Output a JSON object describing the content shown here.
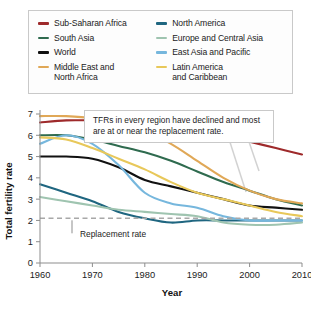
{
  "legend": {
    "items": [
      {
        "label": "Sub-Saharan Africa",
        "color": "#9e2a2b",
        "column": "left"
      },
      {
        "label": "South Asia",
        "color": "#2f6b4f",
        "column": "left"
      },
      {
        "label": "World",
        "color": "#111111",
        "column": "left"
      },
      {
        "label": "Middle East and\nNorth Africa",
        "color": "#e0a857",
        "column": "left"
      },
      {
        "label": "North America",
        "color": "#1f6680",
        "column": "right"
      },
      {
        "label": "Europe and Central Asia",
        "color": "#9fc4b0",
        "column": "right"
      },
      {
        "label": "East Asia and Pacific",
        "color": "#76b7dd",
        "column": "right"
      },
      {
        "label": "Latin America\nand Caribbean",
        "color": "#e8c85a",
        "column": "right"
      }
    ]
  },
  "annotation": {
    "text": "TFRs in every region have declined and most are at or near the replacement rate."
  },
  "replacement": {
    "label": "Replacement rate",
    "value": 2.1
  },
  "chart_data": {
    "type": "line",
    "title": "",
    "xlabel": "Year",
    "ylabel": "Total fertility rate",
    "xlim": [
      1960,
      2010
    ],
    "ylim": [
      0,
      7
    ],
    "xticks": [
      1960,
      1970,
      1980,
      1990,
      2000,
      2010
    ],
    "yticks": [
      0,
      1,
      2,
      3,
      4,
      5,
      6,
      7
    ],
    "grid": false,
    "legend_position": "top",
    "x": [
      1960,
      1965,
      1970,
      1975,
      1980,
      1985,
      1990,
      1995,
      2000,
      2005,
      2010
    ],
    "series": [
      {
        "name": "Sub-Saharan Africa",
        "color": "#9e2a2b",
        "values": [
          6.6,
          6.7,
          6.7,
          6.7,
          6.7,
          6.6,
          6.3,
          6.0,
          5.7,
          5.4,
          5.1
        ]
      },
      {
        "name": "South Asia",
        "color": "#2f6b4f",
        "values": [
          6.0,
          6.0,
          5.8,
          5.5,
          5.2,
          4.8,
          4.3,
          3.8,
          3.4,
          3.0,
          2.7
        ]
      },
      {
        "name": "World",
        "color": "#111111",
        "values": [
          5.0,
          5.0,
          4.9,
          4.5,
          3.9,
          3.6,
          3.3,
          3.0,
          2.7,
          2.6,
          2.5
        ]
      },
      {
        "name": "Middle East and North Africa",
        "color": "#e0a857",
        "values": [
          6.9,
          6.9,
          6.8,
          6.5,
          6.2,
          5.6,
          4.8,
          4.0,
          3.4,
          3.0,
          2.8
        ]
      },
      {
        "name": "North America",
        "color": "#1f6680",
        "values": [
          3.7,
          3.3,
          2.9,
          2.4,
          2.1,
          1.9,
          2.0,
          2.0,
          2.0,
          2.0,
          2.0
        ]
      },
      {
        "name": "Europe and Central Asia",
        "color": "#9fc4b0",
        "values": [
          3.1,
          2.9,
          2.7,
          2.5,
          2.4,
          2.3,
          2.2,
          1.9,
          1.8,
          1.8,
          1.9
        ]
      },
      {
        "name": "East Asia and Pacific",
        "color": "#76b7dd",
        "values": [
          5.6,
          6.0,
          5.6,
          4.6,
          3.3,
          2.8,
          2.6,
          2.2,
          2.0,
          2.0,
          2.0
        ]
      },
      {
        "name": "Latin America and Caribbean",
        "color": "#e8c85a",
        "values": [
          5.9,
          5.8,
          5.4,
          4.9,
          4.4,
          3.8,
          3.3,
          3.0,
          2.7,
          2.4,
          2.2
        ]
      }
    ]
  }
}
